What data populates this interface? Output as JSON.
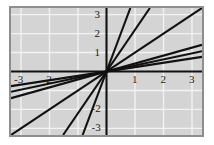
{
  "figure": {
    "background_color": "#ffffff",
    "plot_background_color": "#d4d4d4",
    "frame_color": "#8e8e8e",
    "grid_color": "#f2f2f2",
    "axis_color": "#111111",
    "line_color": "#111111"
  },
  "axis_labels": {
    "x_negative": [
      "-3",
      "-2"
    ],
    "x_positive": [
      "1",
      "2",
      "3"
    ],
    "y_positive": [
      "1",
      "2",
      "3"
    ],
    "y_negative": [
      "-2",
      "-3"
    ]
  },
  "chart_data": {
    "type": "line",
    "title": "",
    "xlabel": "",
    "ylabel": "",
    "xlim": [
      -3.35,
      3.35
    ],
    "ylim": [
      -3.35,
      3.35
    ],
    "grid": true,
    "grid_step": 1,
    "legend": "none",
    "xticks": [
      -3,
      -2,
      -1,
      1,
      2,
      3
    ],
    "yticks": [
      -3,
      -2,
      -1,
      1,
      2,
      3
    ],
    "x": [
      -3.35,
      3.35
    ],
    "series": [
      {
        "name": "y = 4.00x",
        "slope": 4.0,
        "intercept": 0,
        "values": [
          -13.4,
          13.4
        ]
      },
      {
        "name": "y = 2.20x",
        "slope": 2.2,
        "intercept": 0,
        "values": [
          -7.37,
          7.37
        ]
      },
      {
        "name": "y = 1.00x",
        "slope": 1.0,
        "intercept": 0,
        "values": [
          -3.35,
          3.35
        ]
      },
      {
        "name": "y = 0.42x",
        "slope": 0.42,
        "intercept": 0,
        "values": [
          -1.41,
          1.41
        ]
      },
      {
        "name": "y = 0.32x",
        "slope": 0.32,
        "intercept": 0,
        "values": [
          -1.07,
          1.07
        ]
      },
      {
        "name": "y = 0.23x",
        "slope": 0.23,
        "intercept": 0,
        "values": [
          -0.77,
          0.77
        ]
      }
    ]
  }
}
